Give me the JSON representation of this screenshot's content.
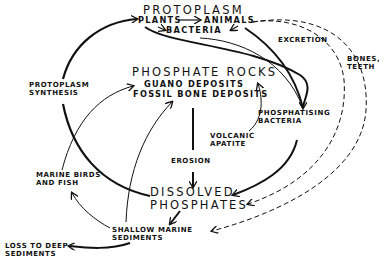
{
  "diagram": {
    "nodes": {
      "protoplasm": "PROTOPLASM",
      "plants": "PLANTS",
      "animals": "ANIMALS",
      "bacteria": "BACTERIA",
      "phosphate_rocks": "PHOSPHATE ROCKS",
      "guano": "GUANO DEPOSITS",
      "fossil_bone": "FOSSIL BONE DEPOSITS",
      "protoplasm_synthesis": "PROTOPLASM\nSYNTHESIS",
      "excretion": "EXCRETION",
      "bones_teeth": "BONES,\nTEETH",
      "phosphatising_bacteria": "PHOSPHATISING\nBACTERIA",
      "volcanic_apatite": "VOLCANIC\nAPATITE",
      "erosion": "EROSION",
      "dissolved_phosphates": "DISSOLVED\nPHOSPHATES",
      "marine_birds": "MARINE BIRDS\nAND FISH",
      "shallow_marine": "SHALLOW MARINE\nSEDIMENTS",
      "loss_deep": "LOSS TO DEEP\nSEDIMENTS"
    },
    "colors": {
      "ink": "#111111",
      "background": "#ffffff"
    }
  }
}
